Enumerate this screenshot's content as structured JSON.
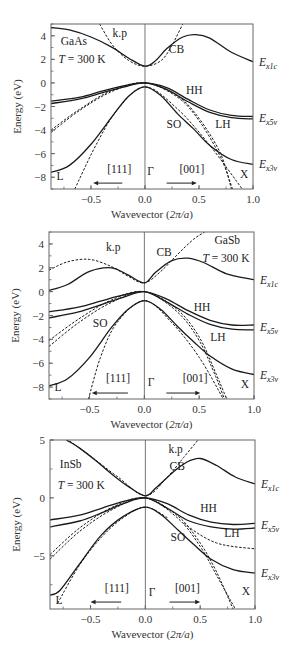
{
  "chart_data": [
    {
      "type": "line",
      "title": "GaAs band structure",
      "material": "GaAs",
      "temperature": "T = 300 K",
      "xlabel": "Wavevector (2π/a)",
      "ylabel": "Energy (eV)",
      "xlim": [
        -0.87,
        1.0
      ],
      "ylim": [
        -9,
        5
      ],
      "xticks": [
        "-0.5",
        "0.0",
        "0.5",
        "1.0"
      ],
      "yticks": [
        "4",
        "2",
        "0",
        "-2",
        "-4",
        "-6",
        "-8"
      ],
      "ytick_values": [
        4,
        2,
        0,
        -2,
        -4,
        -6,
        -8
      ],
      "xtick_values": [
        -0.5,
        0.0,
        0.5,
        1.0
      ],
      "frame": {
        "left": 51,
        "right": 253,
        "top": 24,
        "bottom": 189
      },
      "labels": {
        "kp": "k.p",
        "cb": "CB",
        "hh": "HH",
        "lh": "LH",
        "so": "SO",
        "L": "L",
        "X": "X",
        "gamma": "Γ",
        "dir111": "[111]",
        "dir001": "[001]"
      },
      "right_labels": [
        {
          "main": "E",
          "sub": "x1c",
          "y": 1.8
        },
        {
          "main": "E",
          "sub": "x5v",
          "y": -3.0
        },
        {
          "main": "E",
          "sub": "x3v",
          "y": -6.9
        }
      ],
      "series": [
        {
          "name": "CB",
          "style": "solid",
          "x": [
            -0.87,
            -0.7,
            -0.5,
            -0.3,
            -0.15,
            0,
            0.1,
            0.2,
            0.35,
            0.47,
            0.6,
            0.8,
            1.0
          ],
          "y": [
            4.7,
            4.5,
            3.9,
            3.0,
            2.1,
            1.42,
            1.9,
            2.9,
            3.9,
            4.1,
            3.8,
            2.6,
            1.8
          ]
        },
        {
          "name": "HH",
          "style": "solid",
          "x": [
            -0.87,
            -0.6,
            -0.4,
            -0.2,
            0,
            0.2,
            0.4,
            0.6,
            0.8,
            1.0
          ],
          "y": [
            -1.55,
            -1.2,
            -0.7,
            -0.25,
            0,
            -0.4,
            -1.4,
            -2.3,
            -2.75,
            -2.85
          ]
        },
        {
          "name": "LH",
          "style": "solid",
          "x": [
            -0.87,
            -0.6,
            -0.4,
            -0.2,
            0,
            0.2,
            0.4,
            0.6,
            0.8,
            1.0
          ],
          "y": [
            -1.75,
            -1.35,
            -0.85,
            -0.35,
            0,
            -0.55,
            -1.6,
            -2.5,
            -2.95,
            -3.05
          ]
        },
        {
          "name": "SO",
          "style": "solid",
          "x": [
            -0.87,
            -0.7,
            -0.5,
            -0.3,
            -0.15,
            0,
            0.15,
            0.3,
            0.45,
            0.6,
            0.8,
            1.0
          ],
          "y": [
            -7.6,
            -7.0,
            -5.2,
            -2.8,
            -1.1,
            -0.34,
            -1.1,
            -2.6,
            -3.9,
            -5.3,
            -6.5,
            -6.9
          ]
        },
        {
          "name": "CB k.p",
          "style": "dashed",
          "x": [
            -0.42,
            -0.3,
            -0.15,
            0,
            0.15,
            0.25,
            0.35
          ],
          "y": [
            5.0,
            3.2,
            1.9,
            1.42,
            1.9,
            3.2,
            5.0
          ]
        },
        {
          "name": "HH k.p",
          "style": "dashed",
          "x": [
            -0.87,
            -0.6,
            -0.3,
            0,
            0.3,
            0.5,
            0.7,
            0.8
          ],
          "y": [
            -4.0,
            -2.2,
            -0.6,
            0,
            -1.1,
            -3.0,
            -6.0,
            -9.0
          ]
        },
        {
          "name": "LH k.p",
          "style": "dashed",
          "x": [
            -0.87,
            -0.6,
            -0.3,
            0,
            0.3,
            0.5,
            0.7,
            0.81
          ],
          "y": [
            -4.2,
            -2.3,
            -0.7,
            0,
            -1.2,
            -3.2,
            -6.3,
            -9.0
          ]
        },
        {
          "name": "SO k.p",
          "style": "dashed",
          "x": [
            -0.65,
            -0.45,
            -0.25,
            0,
            0.3,
            0.6,
            0.9
          ],
          "y": [
            -9.0,
            -5.2,
            -2.2,
            -0.34,
            -2.2,
            -5.3,
            -9.0
          ]
        }
      ]
    },
    {
      "type": "line",
      "title": "GaSb band structure",
      "material": "GaSb",
      "temperature": "T = 300 K",
      "xlabel": "Wavevector (2π/a)",
      "ylabel": "Energy (eV)",
      "xlim": [
        -0.87,
        1.0
      ],
      "ylim": [
        -9,
        5
      ],
      "xticks": [
        "-0.5",
        "0.0",
        "0.5",
        "1.0"
      ],
      "yticks": [
        "4",
        "2",
        "0",
        "-2",
        "-4",
        "-6",
        "-8"
      ],
      "ytick_values": [
        4,
        2,
        0,
        -2,
        -4,
        -6,
        -8
      ],
      "xtick_values": [
        -0.5,
        0.0,
        0.5,
        1.0
      ],
      "frame": {
        "left": 49,
        "right": 254,
        "top": 232,
        "bottom": 399
      },
      "labels": {
        "kp": "k.p",
        "cb": "CB",
        "hh": "HH",
        "lh": "LH",
        "so": "SO",
        "L": "L",
        "X": "X",
        "gamma": "Γ",
        "dir111": "[111]",
        "dir001": "[001]"
      },
      "right_labels": [
        {
          "main": "E",
          "sub": "x1c",
          "y": 1.0
        },
        {
          "main": "E",
          "sub": "x5v",
          "y": -3.0
        },
        {
          "main": "E",
          "sub": "x3v",
          "y": -7.0
        }
      ],
      "series": [
        {
          "name": "CB",
          "style": "solid",
          "x": [
            -0.87,
            -0.7,
            -0.5,
            -0.3,
            -0.15,
            0,
            0.1,
            0.25,
            0.4,
            0.55,
            0.75,
            1.0
          ],
          "y": [
            0.1,
            0.6,
            1.7,
            2.0,
            1.4,
            0.73,
            1.6,
            2.6,
            2.8,
            2.4,
            1.5,
            1.0
          ]
        },
        {
          "name": "HH",
          "style": "solid",
          "x": [
            -0.87,
            -0.6,
            -0.4,
            -0.2,
            0,
            0.2,
            0.4,
            0.6,
            0.8,
            1.0
          ],
          "y": [
            -1.7,
            -1.3,
            -0.8,
            -0.3,
            0,
            -0.6,
            -1.6,
            -2.4,
            -2.8,
            -2.8
          ]
        },
        {
          "name": "LH",
          "style": "solid",
          "x": [
            -0.87,
            -0.6,
            -0.4,
            -0.2,
            0,
            0.2,
            0.4,
            0.6,
            0.8,
            1.0
          ],
          "y": [
            -2.2,
            -1.7,
            -1.1,
            -0.5,
            0,
            -0.85,
            -1.9,
            -2.75,
            -3.15,
            -3.2
          ]
        },
        {
          "name": "SO",
          "style": "solid",
          "x": [
            -0.87,
            -0.7,
            -0.5,
            -0.3,
            -0.15,
            0,
            0.15,
            0.3,
            0.45,
            0.6,
            0.8,
            1.0
          ],
          "y": [
            -7.9,
            -7.3,
            -5.5,
            -3.0,
            -1.5,
            -0.76,
            -1.5,
            -2.9,
            -4.2,
            -5.4,
            -6.5,
            -6.95
          ]
        },
        {
          "name": "CB k.p",
          "style": "dashed",
          "x": [
            -0.87,
            -0.7,
            -0.5,
            -0.3,
            -0.15,
            0,
            0.15,
            0.3,
            0.45,
            0.55
          ],
          "y": [
            1.8,
            2.5,
            2.7,
            2.1,
            1.3,
            0.73,
            1.7,
            3.1,
            4.4,
            5.0
          ]
        },
        {
          "name": "HH k.p",
          "style": "dashed",
          "x": [
            -0.87,
            -0.6,
            -0.3,
            0,
            0.3,
            0.5,
            0.65,
            0.75
          ],
          "y": [
            -4.1,
            -2.3,
            -0.7,
            0,
            -1.5,
            -3.8,
            -6.8,
            -9.0
          ]
        },
        {
          "name": "LH k.p",
          "style": "dashed",
          "x": [
            -0.87,
            -0.6,
            -0.3,
            0,
            0.3,
            0.5,
            0.65,
            0.73
          ],
          "y": [
            -4.6,
            -2.6,
            -0.9,
            0,
            -1.7,
            -4.1,
            -7.1,
            -9.0
          ]
        },
        {
          "name": "SO k.p",
          "style": "dashed",
          "x": [
            -0.51,
            -0.4,
            -0.25,
            0,
            0.25,
            0.5,
            0.72
          ],
          "y": [
            -9.0,
            -5.5,
            -2.6,
            -0.76,
            -2.6,
            -5.5,
            -9.0
          ]
        }
      ]
    },
    {
      "type": "line",
      "title": "InSb band structure",
      "material": "InSb",
      "temperature": "T = 300 K",
      "xlabel": "Wavevector (2π/a)",
      "ylabel": "Energy (eV)",
      "xlim": [
        -0.87,
        1.0
      ],
      "ylim": [
        -9.6,
        5
      ],
      "xticks": [
        "-0.5",
        "0.0",
        "0.5",
        "1.0"
      ],
      "yticks": [
        "5",
        "0",
        "-5"
      ],
      "ytick_values": [
        5,
        0,
        -5
      ],
      "xtick_values": [
        -0.5,
        0.0,
        0.5,
        1.0
      ],
      "frame": {
        "left": 50,
        "right": 255,
        "top": 440,
        "bottom": 609
      },
      "labels": {
        "kp": "k.p",
        "cb": "CB",
        "hh": "HH",
        "lh": "LH",
        "so": "SO",
        "L": "L",
        "X": "X",
        "gamma": "Γ",
        "dir111": "[111]",
        "dir001": "[001]"
      },
      "right_labels": [
        {
          "main": "E",
          "sub": "x1c",
          "y": 1.2
        },
        {
          "main": "E",
          "sub": "x5v",
          "y": -2.3
        },
        {
          "main": "E",
          "sub": "x3v",
          "y": -6.5
        }
      ],
      "series": [
        {
          "name": "CB",
          "style": "solid",
          "x": [
            -0.72,
            -0.6,
            -0.45,
            -0.3,
            -0.15,
            0,
            0.1,
            0.25,
            0.38,
            0.5,
            0.65,
            0.82,
            1.0
          ],
          "y": [
            5.0,
            4.3,
            3.2,
            2.0,
            0.95,
            0.18,
            0.9,
            2.2,
            3.1,
            3.4,
            2.8,
            1.8,
            1.2
          ]
        },
        {
          "name": "HH",
          "style": "solid",
          "x": [
            -0.87,
            -0.6,
            -0.4,
            -0.2,
            0,
            0.2,
            0.4,
            0.6,
            0.8,
            1.0
          ],
          "y": [
            -1.9,
            -1.5,
            -0.9,
            -0.3,
            0,
            -0.5,
            -1.5,
            -2.1,
            -2.3,
            -2.2
          ]
        },
        {
          "name": "LH",
          "style": "solid",
          "x": [
            -0.87,
            -0.6,
            -0.4,
            -0.2,
            0,
            0.2,
            0.4,
            0.6,
            0.8,
            1.0
          ],
          "y": [
            -2.5,
            -2.0,
            -1.3,
            -0.5,
            0,
            -0.9,
            -2.0,
            -2.5,
            -2.7,
            -2.6
          ]
        },
        {
          "name": "SO",
          "style": "solid",
          "x": [
            -0.87,
            -0.78,
            -0.6,
            -0.4,
            -0.2,
            0,
            0.15,
            0.3,
            0.45,
            0.6,
            0.8,
            1.0
          ],
          "y": [
            -8.4,
            -8.0,
            -5.7,
            -3.2,
            -1.6,
            -0.8,
            -1.5,
            -2.8,
            -4.1,
            -5.3,
            -6.2,
            -6.5
          ]
        },
        {
          "name": "CB k.p",
          "style": "dashed",
          "x": [
            -0.72,
            -0.5,
            -0.25,
            0,
            0.2,
            0.35,
            0.48
          ],
          "y": [
            5.1,
            3.6,
            1.8,
            0.18,
            1.8,
            3.5,
            5.0
          ]
        },
        {
          "name": "HH k.p",
          "style": "dashed",
          "x": [
            -0.87,
            -0.6,
            -0.3,
            0,
            0.3,
            0.5,
            0.65,
            0.8
          ],
          "y": [
            -4.9,
            -2.6,
            -0.8,
            0,
            -1.6,
            -3.9,
            -6.4,
            -9.6
          ]
        },
        {
          "name": "LH k.p",
          "style": "dashed",
          "x": [
            -0.87,
            -0.6,
            -0.3,
            0,
            0.3,
            0.5,
            0.65,
            0.82
          ],
          "y": [
            -5.3,
            -2.9,
            -1.0,
            0,
            -1.8,
            -4.2,
            -6.7,
            -9.6
          ]
        },
        {
          "name": "LH flat k.p",
          "style": "dashed",
          "x": [
            0.35,
            0.5,
            0.65,
            0.8,
            1.0
          ],
          "y": [
            -2.2,
            -3.2,
            -3.9,
            -4.2,
            -4.4
          ]
        },
        {
          "name": "SO k.p",
          "style": "dashed",
          "x": [
            -0.8,
            -0.6,
            -0.4,
            -0.2,
            0,
            0.2
          ],
          "y": [
            -9.1,
            -5.8,
            -3.4,
            -1.7,
            -0.8,
            -1.7
          ]
        }
      ]
    }
  ],
  "panels_text": [
    {
      "material": "GaAs",
      "temp": "T = 300 K"
    },
    {
      "material": "GaSb",
      "temp": "T = 300 K"
    },
    {
      "material": "InSb",
      "temp": "T = 300 K"
    }
  ]
}
